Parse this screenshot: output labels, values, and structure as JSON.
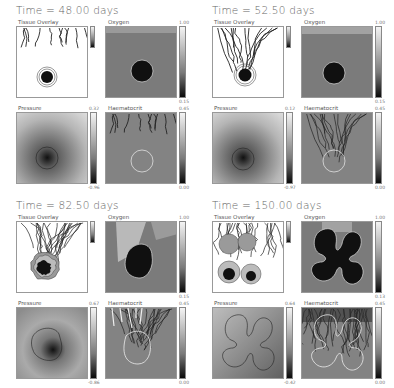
{
  "figure": {
    "panel_labels": {
      "tissue": "Tissue Overlay",
      "oxygen": "Oxygen",
      "pressure": "Pressure",
      "haematocrit": "Haematocrit"
    },
    "quadrants": [
      {
        "title": "Time = 48.00 days",
        "oxygen_max": "1.00",
        "oxygen_min": "0.15",
        "pressure_max": "0.32",
        "pressure_min": "-0.96",
        "haem_max": "0.45",
        "haem_min": "0.00"
      },
      {
        "title": "Time = 52.50 days",
        "oxygen_max": "1.00",
        "oxygen_min": "0.15",
        "pressure_max": "0.12",
        "pressure_min": "-0.97",
        "haem_max": "0.45",
        "haem_min": "0.00"
      },
      {
        "title": "Time = 82.50 days",
        "oxygen_max": "1.00",
        "oxygen_min": "0.15",
        "pressure_max": "0.67",
        "pressure_min": "-0.86",
        "haem_max": "0.45",
        "haem_min": "0.00"
      },
      {
        "title": "Time = 150.00 days",
        "oxygen_max": "1.00",
        "oxygen_min": "0.13",
        "pressure_max": "0.64",
        "pressure_min": "-0.42",
        "haem_max": "0.45",
        "haem_min": "0.00"
      }
    ]
  },
  "colors": {
    "field_gray": "#8a8a8a",
    "tumor_dark": "#101010",
    "vessel": "#222222",
    "contour_white": "#f0f0f0",
    "contour_dark": "#333333"
  }
}
